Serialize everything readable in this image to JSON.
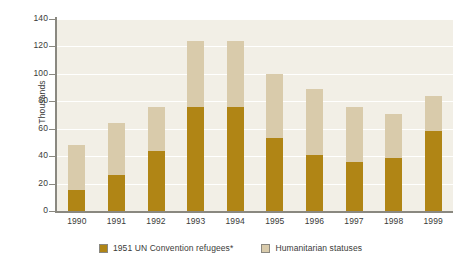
{
  "chart_data": {
    "type": "bar",
    "subtype": "stacked",
    "title": "",
    "subtitle": "",
    "xlabel": "",
    "ylabel": "Thousands",
    "ylim": [
      0,
      140
    ],
    "ytick_step": 20,
    "yticks": [
      0,
      20,
      40,
      60,
      80,
      100,
      120,
      140
    ],
    "ytick_labels": [
      "0",
      "20",
      "40",
      "60",
      "80",
      "100",
      "120",
      "140"
    ],
    "categories": [
      "1990",
      "1991",
      "1992",
      "1993",
      "1994",
      "1995",
      "1996",
      "1997",
      "1998",
      "1999"
    ],
    "grid": "horizontal",
    "legend_position": "bottom",
    "series": [
      {
        "name": "1951 UN Convention refugees*",
        "color": "#b08515",
        "values": [
          15,
          26,
          44,
          76,
          76,
          53,
          41,
          36,
          39,
          58
        ]
      },
      {
        "name": "Humanitarian statuses",
        "color": "#d9cbab",
        "values": [
          33,
          38,
          32,
          48,
          48,
          47,
          48,
          40,
          32,
          26
        ]
      }
    ],
    "totals": [
      48,
      64,
      76,
      124,
      124,
      100,
      89,
      76,
      71,
      84
    ],
    "plot_background": "#f2efe6",
    "axis_color": "#8a8880"
  },
  "legend": {
    "items": [
      {
        "label": "1951 UN Convention refugees*",
        "swatch": "#b08515"
      },
      {
        "label": "Humanitarian statuses",
        "swatch": "#d9cbab"
      }
    ]
  }
}
